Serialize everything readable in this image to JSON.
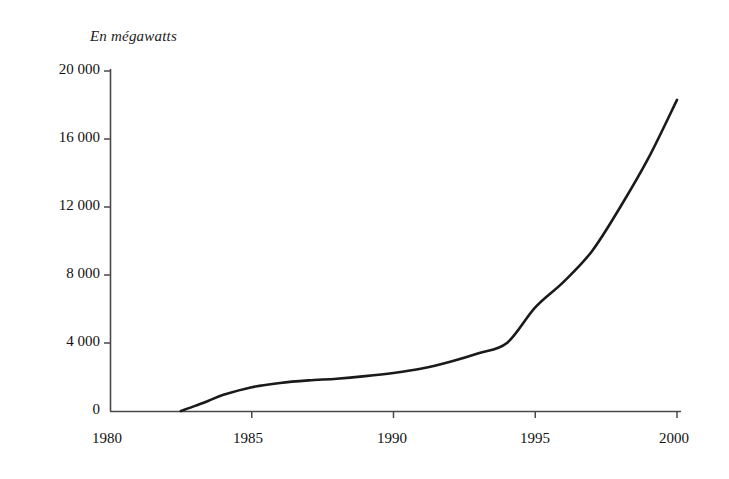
{
  "chart_data": {
    "type": "line",
    "title": "En mégawatts",
    "xlabel": "",
    "ylabel": "En mégawatts",
    "xlim": [
      1980,
      2000.5
    ],
    "ylim": [
      0,
      20000
    ],
    "grid": false,
    "legend": "none",
    "x_ticks": [
      "1980",
      "1985",
      "1990",
      "1995",
      "2000"
    ],
    "x_tick_values": [
      1980,
      1985,
      1990,
      1995,
      2000
    ],
    "y_ticks": [
      "0",
      "4 000",
      "8 000",
      "12 000",
      "16 000",
      "20 000"
    ],
    "y_tick_values": [
      0,
      4000,
      8000,
      12000,
      16000,
      20000
    ],
    "series": [
      {
        "name": "Puissance installée",
        "color": "#1a1a1a",
        "x": [
          1982.5,
          1983,
          1983.5,
          1984,
          1985,
          1986,
          1987,
          1988,
          1989,
          1990,
          1991,
          1992,
          1993,
          1994,
          1995,
          1996,
          1997,
          1998,
          1999,
          2000
        ],
        "values": [
          0,
          300,
          620,
          950,
          1400,
          1650,
          1800,
          1900,
          2050,
          2240,
          2500,
          2900,
          3400,
          4000,
          6100,
          7600,
          9400,
          12000,
          14900,
          18300
        ]
      }
    ]
  },
  "labels": {
    "title": "En mégawatts",
    "y0": "0",
    "y1": "4 000",
    "y2": "8 000",
    "y3": "12 000",
    "y4": "16 000",
    "y5": "20 000",
    "x0": "1980",
    "x1": "1985",
    "x2": "1990",
    "x3": "1995",
    "x4": "2000"
  },
  "colors": {
    "line": "#1a1a1a",
    "axis": "#4a4a4a",
    "text": "#111111",
    "background": "#ffffff"
  }
}
